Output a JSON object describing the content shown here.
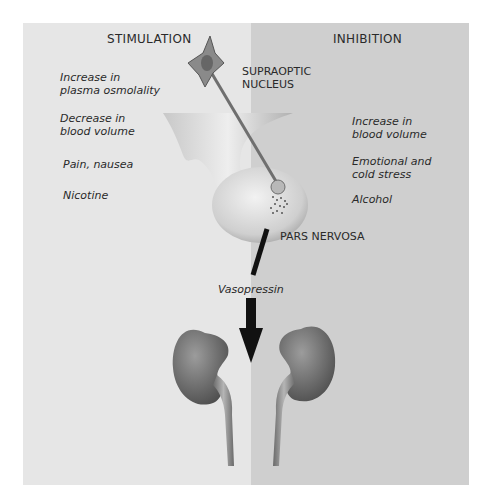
{
  "diagram": {
    "headings": {
      "stimulation": "STIMULATION",
      "inhibition": "INHIBITION"
    },
    "stimulation_factors": [
      {
        "line1": "Increase in",
        "line2": "plasma osmolality"
      },
      {
        "line1": "Decrease in",
        "line2": "blood volume"
      },
      {
        "line1": "Pain, nausea",
        "line2": ""
      },
      {
        "line1": "Nicotine",
        "line2": ""
      }
    ],
    "inhibition_factors": [
      {
        "line1": "Increase in",
        "line2": "blood volume"
      },
      {
        "line1": "Emotional and",
        "line2": "cold stress"
      },
      {
        "line1": "Alcohol",
        "line2": ""
      }
    ],
    "labels": {
      "supraoptic_line1": "SUPRAOPTIC",
      "supraoptic_line2": "NUCLEUS",
      "pars_nervosa": "PARS NERVOSA",
      "hormone": "Vasopressin"
    },
    "colors": {
      "left_panel": "#e6e6e6",
      "right_panel": "#cfcfcf",
      "neuron": "#7a7a7a",
      "kidney": "#6e6e6e",
      "arrow": "#111111"
    }
  }
}
